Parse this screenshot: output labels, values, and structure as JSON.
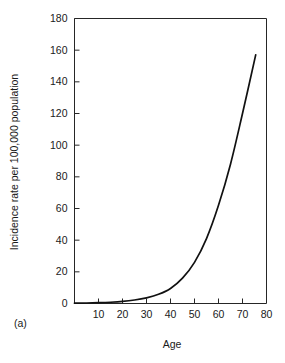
{
  "figure": {
    "panel_label": "(a)"
  },
  "chart_data": {
    "type": "line",
    "title": "",
    "xlabel": "Age",
    "ylabel": "Incidence rate per 100,000 population",
    "xlim": [
      0,
      80
    ],
    "ylim": [
      0,
      180
    ],
    "grid": false,
    "legend": null,
    "x_ticks": [
      0,
      10,
      20,
      30,
      40,
      50,
      60,
      70,
      80
    ],
    "x_tick_labels": [
      "",
      "10",
      "20",
      "30",
      "40",
      "50",
      "60",
      "70",
      "80"
    ],
    "y_ticks": [
      0,
      20,
      40,
      60,
      80,
      100,
      120,
      140,
      160,
      180
    ],
    "y_tick_labels": [
      "0",
      "20",
      "40",
      "60",
      "80",
      "100",
      "120",
      "140",
      "160",
      "180"
    ],
    "series": [
      {
        "name": "Incidence rate",
        "x": [
          0,
          5,
          10,
          15,
          20,
          25,
          30,
          35,
          40,
          45,
          50,
          55,
          60,
          65,
          70,
          75.5
        ],
        "values": [
          0.2,
          0.3,
          0.5,
          0.8,
          1.3,
          2.2,
          3.6,
          5.8,
          9.5,
          16,
          26,
          41,
          62,
          88,
          120,
          157
        ]
      }
    ]
  }
}
